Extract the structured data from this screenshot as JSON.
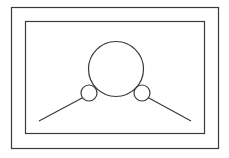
{
  "diagram": {
    "background": "#ffffff",
    "stroke_color": "#3a3a3a",
    "outer_frame": {
      "x": 11.5,
      "y": 7.5,
      "width": 207,
      "height": 141
    },
    "inner_frame": {
      "x": 25.5,
      "y": 21.5,
      "width": 179,
      "height": 112
    },
    "large_circle": {
      "cx": 116,
      "cy": 69,
      "r": 27.5
    },
    "small_circles": [
      {
        "cx": 89,
        "cy": 93,
        "r": 8
      },
      {
        "cx": 142,
        "cy": 93,
        "r": 8
      }
    ],
    "lines": [
      {
        "x1": 39,
        "y1": 121,
        "x2": 83,
        "y2": 97.5
      },
      {
        "x1": 148,
        "y1": 97.5,
        "x2": 191,
        "y2": 121
      }
    ]
  }
}
